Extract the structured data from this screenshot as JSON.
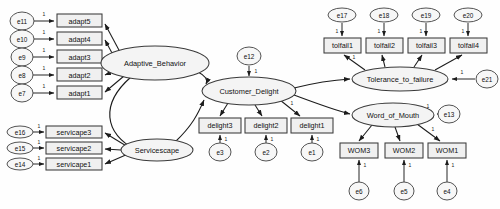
{
  "diagram": {
    "type": "structural-equation-model-path-diagram",
    "title": "",
    "background_color": "#fefefe",
    "node_fill": "#f0f0f0",
    "node_stroke": "#3a3a3a",
    "edge_color": "#1c1c1c",
    "default_coefficient_label": "1",
    "latent_variables": [
      {
        "id": "adaptive_behavior",
        "label": "Adaptive_Behavior",
        "cx": 155,
        "cy": 63,
        "rx": 54,
        "ry": 17
      },
      {
        "id": "servicescape",
        "label": "Servicescape",
        "cx": 157,
        "cy": 150,
        "rx": 36,
        "ry": 11
      },
      {
        "id": "customer_delight",
        "label": "Customer_Delight",
        "cx": 249,
        "cy": 91,
        "rx": 47,
        "ry": 14
      },
      {
        "id": "tolerance_to_failure",
        "label": "Tolerance_to_failure",
        "cx": 400,
        "cy": 79,
        "rx": 48,
        "ry": 12
      },
      {
        "id": "word_of_mouth",
        "label": "Word_of_Mouth",
        "cx": 393,
        "cy": 115,
        "rx": 41,
        "ry": 12
      }
    ],
    "observed_variables": [
      {
        "id": "adapt5",
        "label": "adapt5",
        "x": 57,
        "y": 14,
        "w": 45,
        "h": 13
      },
      {
        "id": "adapt4",
        "label": "adapt4",
        "x": 57,
        "y": 32,
        "w": 45,
        "h": 13
      },
      {
        "id": "adapt3",
        "label": "adapt3",
        "x": 57,
        "y": 50,
        "w": 45,
        "h": 13
      },
      {
        "id": "adapt2",
        "label": "adapt2",
        "x": 57,
        "y": 68,
        "w": 45,
        "h": 13
      },
      {
        "id": "adapt1",
        "label": "adapt1",
        "x": 57,
        "y": 86,
        "w": 45,
        "h": 13
      },
      {
        "id": "servicape3",
        "label": "servicape3",
        "x": 46,
        "y": 126,
        "w": 56,
        "h": 12
      },
      {
        "id": "servicape2",
        "label": "servicape2",
        "x": 46,
        "y": 142,
        "w": 56,
        "h": 12
      },
      {
        "id": "servicape1",
        "label": "servicape1",
        "x": 46,
        "y": 158,
        "w": 56,
        "h": 12
      },
      {
        "id": "delight3",
        "label": "delight3",
        "x": 199,
        "y": 118,
        "w": 42,
        "h": 15
      },
      {
        "id": "delight2",
        "label": "delight2",
        "x": 245,
        "y": 118,
        "w": 42,
        "h": 15
      },
      {
        "id": "delight1",
        "label": "delight1",
        "x": 291,
        "y": 118,
        "w": 42,
        "h": 15
      },
      {
        "id": "tolfail1",
        "label": "tolfail1",
        "x": 324,
        "y": 38,
        "w": 37,
        "h": 15
      },
      {
        "id": "tolfail2",
        "label": "tolfail2",
        "x": 366,
        "y": 38,
        "w": 37,
        "h": 15
      },
      {
        "id": "tolfail3",
        "label": "tolfail3",
        "x": 408,
        "y": 38,
        "w": 37,
        "h": 15
      },
      {
        "id": "tolfail4",
        "label": "tolfail4",
        "x": 450,
        "y": 38,
        "w": 37,
        "h": 15
      },
      {
        "id": "wom3",
        "label": "WOM3",
        "x": 340,
        "y": 143,
        "w": 38,
        "h": 15
      },
      {
        "id": "wom2",
        "label": "WOM2",
        "x": 385,
        "y": 143,
        "w": 38,
        "h": 15
      },
      {
        "id": "wom1",
        "label": "WOM1",
        "x": 428,
        "y": 143,
        "w": 38,
        "h": 15
      }
    ],
    "error_terms": [
      {
        "id": "e11",
        "label": "e11",
        "cx": 22,
        "cy": 21,
        "rx": 12,
        "ry": 9
      },
      {
        "id": "e10",
        "label": "e10",
        "cx": 22,
        "cy": 39,
        "rx": 12,
        "ry": 9
      },
      {
        "id": "e9",
        "label": "e9",
        "cx": 22,
        "cy": 57,
        "rx": 11,
        "ry": 9
      },
      {
        "id": "e8",
        "label": "e8",
        "cx": 22,
        "cy": 75,
        "rx": 11,
        "ry": 9
      },
      {
        "id": "e7",
        "label": "e7",
        "cx": 22,
        "cy": 93,
        "rx": 11,
        "ry": 9
      },
      {
        "id": "e16",
        "label": "e16",
        "cx": 20,
        "cy": 132,
        "rx": 13,
        "ry": 6
      },
      {
        "id": "e15",
        "label": "e15",
        "cx": 20,
        "cy": 148,
        "rx": 13,
        "ry": 6
      },
      {
        "id": "e14",
        "label": "e14",
        "cx": 20,
        "cy": 164,
        "rx": 13,
        "ry": 6
      },
      {
        "id": "e12",
        "label": "e12",
        "cx": 249,
        "cy": 56,
        "rx": 12,
        "ry": 9
      },
      {
        "id": "e3",
        "label": "e3",
        "cx": 220,
        "cy": 152,
        "rx": 11,
        "ry": 9
      },
      {
        "id": "e2",
        "label": "e2",
        "cx": 266,
        "cy": 152,
        "rx": 11,
        "ry": 9
      },
      {
        "id": "e1",
        "label": "e1",
        "cx": 312,
        "cy": 152,
        "rx": 11,
        "ry": 9
      },
      {
        "id": "e17",
        "label": "e17",
        "cx": 342,
        "cy": 15,
        "rx": 14,
        "ry": 7
      },
      {
        "id": "e18",
        "label": "e18",
        "cx": 384,
        "cy": 15,
        "rx": 14,
        "ry": 7
      },
      {
        "id": "e19",
        "label": "e19",
        "cx": 426,
        "cy": 15,
        "rx": 14,
        "ry": 7
      },
      {
        "id": "e20",
        "label": "e20",
        "cx": 468,
        "cy": 15,
        "rx": 14,
        "ry": 7
      },
      {
        "id": "e21",
        "label": "e21",
        "cx": 487,
        "cy": 79,
        "rx": 11,
        "ry": 9
      },
      {
        "id": "e13",
        "label": "e13",
        "cx": 449,
        "cy": 114,
        "rx": 11,
        "ry": 9
      },
      {
        "id": "e6",
        "label": "e6",
        "cx": 359,
        "cy": 191,
        "rx": 10,
        "ry": 9
      },
      {
        "id": "e5",
        "label": "e5",
        "cx": 404,
        "cy": 191,
        "rx": 10,
        "ry": 9
      },
      {
        "id": "e4",
        "label": "e4",
        "cx": 447,
        "cy": 191,
        "rx": 10,
        "ry": 9
      }
    ],
    "measurement_paths": [
      {
        "from": "adaptive_behavior",
        "to": "adapt5",
        "coefficient": ""
      },
      {
        "from": "adaptive_behavior",
        "to": "adapt4",
        "coefficient": ""
      },
      {
        "from": "adaptive_behavior",
        "to": "adapt3",
        "coefficient": ""
      },
      {
        "from": "adaptive_behavior",
        "to": "adapt2",
        "coefficient": "1"
      },
      {
        "from": "adaptive_behavior",
        "to": "adapt1",
        "coefficient": ""
      },
      {
        "from": "servicescape",
        "to": "servicape3",
        "coefficient": ""
      },
      {
        "from": "servicescape",
        "to": "servicape2",
        "coefficient": ""
      },
      {
        "from": "servicescape",
        "to": "servicape1",
        "coefficient": ""
      },
      {
        "from": "customer_delight",
        "to": "delight3",
        "coefficient": ""
      },
      {
        "from": "customer_delight",
        "to": "delight2",
        "coefficient": ""
      },
      {
        "from": "customer_delight",
        "to": "delight1",
        "coefficient": "1"
      },
      {
        "from": "tolerance_to_failure",
        "to": "tolfail1",
        "coefficient": "1"
      },
      {
        "from": "tolerance_to_failure",
        "to": "tolfail2",
        "coefficient": ""
      },
      {
        "from": "tolerance_to_failure",
        "to": "tolfail3",
        "coefficient": ""
      },
      {
        "from": "tolerance_to_failure",
        "to": "tolfail4",
        "coefficient": ""
      },
      {
        "from": "word_of_mouth",
        "to": "wom3",
        "coefficient": ""
      },
      {
        "from": "word_of_mouth",
        "to": "wom2",
        "coefficient": ""
      },
      {
        "from": "word_of_mouth",
        "to": "wom1",
        "coefficient": "1"
      }
    ],
    "structural_paths": [
      {
        "from": "adaptive_behavior",
        "to": "customer_delight"
      },
      {
        "from": "servicescape",
        "to": "customer_delight"
      },
      {
        "from": "customer_delight",
        "to": "tolerance_to_failure"
      },
      {
        "from": "customer_delight",
        "to": "word_of_mouth"
      }
    ],
    "covariances": [
      {
        "between": [
          "adaptive_behavior",
          "servicescape"
        ],
        "style": "curved-double-headed"
      }
    ],
    "error_paths": [
      {
        "from": "e11",
        "to": "adapt5",
        "coefficient": "1"
      },
      {
        "from": "e10",
        "to": "adapt4",
        "coefficient": "1"
      },
      {
        "from": "e9",
        "to": "adapt3",
        "coefficient": "1"
      },
      {
        "from": "e8",
        "to": "adapt2",
        "coefficient": "1"
      },
      {
        "from": "e7",
        "to": "adapt1",
        "coefficient": "1"
      },
      {
        "from": "e16",
        "to": "servicape3",
        "coefficient": "1"
      },
      {
        "from": "e15",
        "to": "servicape2",
        "coefficient": "1"
      },
      {
        "from": "e14",
        "to": "servicape1",
        "coefficient": "1"
      },
      {
        "from": "e12",
        "to": "customer_delight",
        "coefficient": "1"
      },
      {
        "from": "e3",
        "to": "delight3",
        "coefficient": "1"
      },
      {
        "from": "e2",
        "to": "delight2",
        "coefficient": "1"
      },
      {
        "from": "e1",
        "to": "delight1",
        "coefficient": "1"
      },
      {
        "from": "e17",
        "to": "tolfail1",
        "coefficient": "1"
      },
      {
        "from": "e18",
        "to": "tolfail2",
        "coefficient": "1"
      },
      {
        "from": "e19",
        "to": "tolfail3",
        "coefficient": "1"
      },
      {
        "from": "e20",
        "to": "tolfail4",
        "coefficient": "1"
      },
      {
        "from": "e21",
        "to": "tolerance_to_failure",
        "coefficient": "1"
      },
      {
        "from": "e13",
        "to": "word_of_mouth",
        "coefficient": "1"
      },
      {
        "from": "e6",
        "to": "wom3",
        "coefficient": "1"
      },
      {
        "from": "e5",
        "to": "wom2",
        "coefficient": "1"
      },
      {
        "from": "e4",
        "to": "wom1",
        "coefficient": "1"
      }
    ]
  }
}
